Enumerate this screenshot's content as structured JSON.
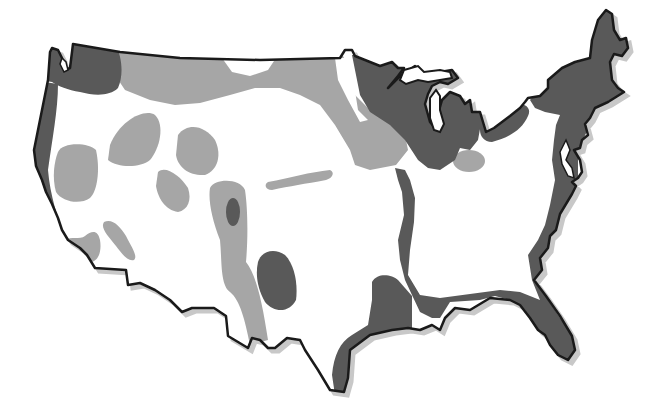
{
  "map": {
    "subject": "Contiguous United States",
    "style": "grayscale zone map, no labels",
    "colors": {
      "background": "#ffffff",
      "land": "#ffffff",
      "outline": "#1a1a1a",
      "shadow": "#bdbdbd",
      "dark_zone": "#595959",
      "light_zone": "#a6a6a6"
    },
    "legend": [],
    "zones": [
      {
        "id": "pacific-northwest",
        "shade": "dark"
      },
      {
        "id": "pacific-coast-strip",
        "shade": "dark"
      },
      {
        "id": "northern-plains-band",
        "shade": "light"
      },
      {
        "id": "montana-clear-patch",
        "shade": "white"
      },
      {
        "id": "great-basin-blob-nevada",
        "shade": "light"
      },
      {
        "id": "idaho-blob",
        "shade": "light"
      },
      {
        "id": "wyoming-blob",
        "shade": "light"
      },
      {
        "id": "utah-blob",
        "shade": "light"
      },
      {
        "id": "central-valley-ca",
        "shade": "light"
      },
      {
        "id": "southern-ca-blob",
        "shade": "light"
      },
      {
        "id": "arizona-streak",
        "shade": "light"
      },
      {
        "id": "rockies-colorado-nm",
        "shade": "light"
      },
      {
        "id": "colorado-core",
        "shade": "dark"
      },
      {
        "id": "kansas-streak",
        "shade": "light"
      },
      {
        "id": "west-texas-blob",
        "shade": "dark"
      },
      {
        "id": "upper-midwest-great-lakes",
        "shade": "dark"
      },
      {
        "id": "ohio-light-patch",
        "shade": "light"
      },
      {
        "id": "lake-erie-ontario-strip",
        "shade": "dark"
      },
      {
        "id": "northeast-appalachian-atlantic",
        "shade": "dark"
      },
      {
        "id": "mississippi-valley",
        "shade": "dark"
      },
      {
        "id": "gulf-coast",
        "shade": "dark"
      },
      {
        "id": "florida-peninsula",
        "shade": "dark"
      },
      {
        "id": "texas-gulf-coast",
        "shade": "dark"
      }
    ]
  }
}
